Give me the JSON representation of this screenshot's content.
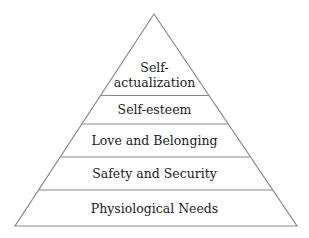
{
  "diagram": {
    "type": "pyramid",
    "colors": {
      "line": "#8a8a8a",
      "text": "#1a1a1a",
      "background": "#ffffff"
    },
    "levels": [
      {
        "label_line1": "Self-",
        "label_line2": "actualization"
      },
      {
        "label": "Self-esteem"
      },
      {
        "label": "Love and Belonging"
      },
      {
        "label": "Safety and Security"
      },
      {
        "label": "Physiological Needs"
      }
    ]
  }
}
